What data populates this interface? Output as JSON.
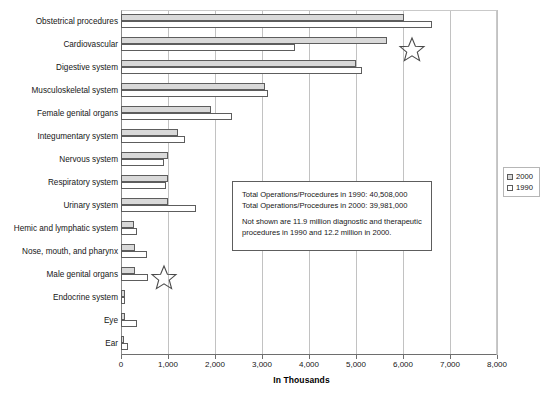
{
  "chart_data": {
    "type": "bar",
    "orientation": "horizontal",
    "title": "",
    "xlabel": "In Thousands",
    "ylabel": "",
    "xlim": [
      0,
      8000
    ],
    "xticks": [
      "0",
      "1,000",
      "2,000",
      "3,000",
      "4,000",
      "5,000",
      "6,000",
      "7,000",
      "8,000"
    ],
    "xtick_values": [
      0,
      1000,
      2000,
      3000,
      4000,
      5000,
      6000,
      7000,
      8000
    ],
    "grid": true,
    "legend_position": "right",
    "categories": [
      "Obstetrical procedures",
      "Cardiovascular",
      "Digestive system",
      "Musculoskeletal system",
      "Female genital organs",
      "Integumentary system",
      "Nervous system",
      "Respiratory system",
      "Urinary system",
      "Hemic and lymphatic system",
      "Nose, mouth, and pharynx",
      "Male genital organs",
      "Endocrine system",
      "Eye",
      "Ear"
    ],
    "series": [
      {
        "name": "2000",
        "color": "#d9d9d9",
        "values": [
          6020,
          5660,
          4990,
          3060,
          1910,
          1210,
          1000,
          1000,
          1000,
          280,
          290,
          290,
          80,
          80,
          50
        ]
      },
      {
        "name": "1990",
        "color": "#ffffff",
        "values": [
          6620,
          3700,
          5120,
          3130,
          2360,
          1360,
          910,
          960,
          1600,
          340,
          560,
          580,
          90,
          330,
          150
        ]
      }
    ],
    "annotations": [
      {
        "name": "summary-note",
        "lines": [
          "Total Operations/Procedures in 1990: 40,508,000",
          "Total Operations/Procedures in 2000: 39,981,000",
          "Not shown are 11.9 million diagnostic and therapeutic",
          "procedures in 1990 and 12.2 million  in 2000."
        ]
      },
      {
        "name": "star-marker-cardiovascular",
        "shape": "star"
      },
      {
        "name": "star-marker-male-genital-organs",
        "shape": "star"
      }
    ]
  },
  "legend": {
    "items": [
      {
        "label": "2000",
        "swatch": "filled-gray"
      },
      {
        "label": "1990",
        "swatch": "white"
      }
    ]
  },
  "colors": {
    "series_2000": "#d9d9d9",
    "series_1990": "#ffffff",
    "bar_outline": "#5d5d5d",
    "gridline": "#c2c2c2",
    "axis": "#6e6e6e",
    "text": "#161616"
  }
}
